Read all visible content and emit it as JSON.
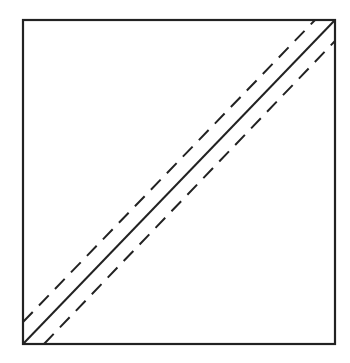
{
  "diagram": {
    "width": 350,
    "height": 363,
    "stroke_color": "#222222",
    "background": "#ffffff",
    "box": {
      "x1": 23,
      "y1": 20,
      "x2": 335,
      "y2": 344
    },
    "main_diagonal": {
      "x1": 23,
      "y1": 344,
      "x2": 335,
      "y2": 20,
      "style": "solid"
    },
    "upper_dashed": {
      "x1": 23,
      "y1": 322,
      "x2": 315,
      "y2": 20,
      "style": "dashed"
    },
    "lower_dashed": {
      "x1": 44,
      "y1": 344,
      "x2": 335,
      "y2": 41,
      "style": "dashed"
    },
    "dash_pattern": "14 9"
  }
}
